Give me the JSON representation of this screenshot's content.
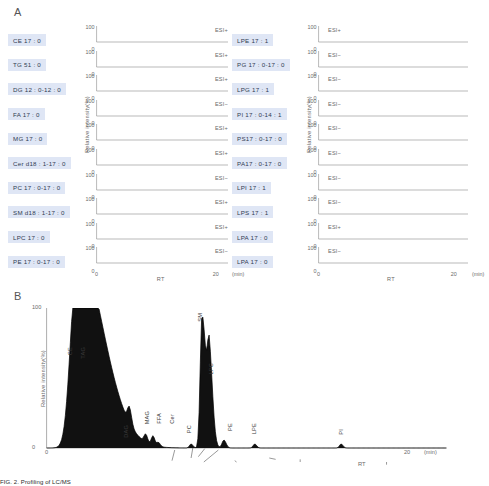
{
  "figure": {
    "panel_a_letter": "A",
    "panel_b_letter": "B",
    "caption": "FIG. 2.  Profiling of LC/MS"
  },
  "axes": {
    "y_label": "Relative intensity(%)",
    "y_top": "100",
    "y_zero": "0",
    "x_label": "RT",
    "x_zero": "0",
    "x_max": "20",
    "x_unit": "(min)"
  },
  "panel_a": {
    "left_group": {
      "rows": [
        {
          "label": "CE 17 : 0",
          "esi": "ESI+",
          "rt": 1.4,
          "width": 0.55,
          "height": 100,
          "tail": 0.9
        },
        {
          "label": "TG 51 : 0",
          "esi": "ESI+",
          "rt": 1.7,
          "width": 0.75,
          "height": 100,
          "tail": 1.6
        },
        {
          "label": "DG 12 : 0-12 : 0",
          "esi": "ESI+",
          "rt": 4.4,
          "width": 0.22,
          "height": 100,
          "tail": 0.2
        },
        {
          "label": "FA 17 : 0",
          "esi": "ESI−",
          "rt": 5.7,
          "width": 0.2,
          "height": 100,
          "tail": 0.2
        },
        {
          "label": "MG 17 : 0",
          "esi": "ESI+",
          "rt": 5.3,
          "width": 0.2,
          "height": 100,
          "tail": 0.2
        },
        {
          "label": "Cer d18 : 1-17 : 0",
          "esi": "ESI+",
          "rt": 5.4,
          "width": 0.2,
          "height": 100,
          "tail": 0.2
        },
        {
          "label": "PC 17 : 0-17 : 0",
          "esi": "ESI−",
          "rt": 6.4,
          "width": 0.22,
          "height": 100,
          "tail": 0.3
        },
        {
          "label": "SM d18 : 1-17 : 0",
          "esi": "ESI+",
          "rt": 6.6,
          "width": 0.22,
          "height": 100,
          "tail": 0.3
        },
        {
          "label": "LPC 17 : 0",
          "esi": "ESI+",
          "rt": 6.9,
          "width": 0.22,
          "height": 100,
          "tail": 0.3
        },
        {
          "label": "PE 17 : 0-17 : 0",
          "esi": "ESI−",
          "rt": 7.0,
          "width": 0.22,
          "height": 100,
          "tail": 0.3
        }
      ]
    },
    "right_group": {
      "rows": [
        {
          "label": "LPE 17 : 1",
          "esi": "ESI+",
          "rt": 5.6,
          "width": 0.22,
          "height": 100,
          "tail": 0.3
        },
        {
          "label": "PG 17 : 0-17 : 0",
          "esi": "ESI−",
          "rt": 6.3,
          "width": 0.22,
          "height": 100,
          "tail": 0.3
        },
        {
          "label": "LPG 17 : 1",
          "esi": "ESI−",
          "rt": 7.9,
          "width": 0.25,
          "height": 100,
          "tail": 0.4
        },
        {
          "label": "PI 17 : 0-14 : 1",
          "esi": "ESI−",
          "rt": 8.9,
          "width": 0.25,
          "height": 100,
          "tail": 0.4
        },
        {
          "label": "PS17 : 0-17 : 0",
          "esi": "ESI−",
          "rt": 9.1,
          "width": 0.28,
          "height": 100,
          "tail": 0.6
        },
        {
          "label": "PA17 : 0-17 : 0",
          "esi": "ESI−",
          "rt": 9.3,
          "width": 0.3,
          "height": 100,
          "tail": 0.7
        },
        {
          "label": "LPI 17 : 1",
          "esi": "ESI−",
          "rt": 9.5,
          "width": 0.35,
          "height": 100,
          "tail": 1.1
        },
        {
          "label": "LPS 17 : 1",
          "esi": "ESI−",
          "rt": 11.0,
          "width": 0.3,
          "height": 100,
          "tail": 0.6
        },
        {
          "label": "LPA 17 : 0",
          "esi": "ESI+",
          "rt": 12.2,
          "width": 0.35,
          "height": 100,
          "tail": 0.9
        },
        {
          "label": "LPA 17 : 0",
          "esi": "ESI−",
          "rt": 14.4,
          "width": 0.55,
          "height": 100,
          "tail": 1.8
        }
      ]
    }
  },
  "chart_data": {
    "type": "line",
    "title": "",
    "xlabel": "RT",
    "ylabel": "Relative intensity(%)",
    "xlim": [
      0,
      22
    ],
    "ylim": [
      0,
      105
    ],
    "x_ticks": [
      "0",
      "20"
    ],
    "y_ticks": [
      "0",
      "100"
    ],
    "x_unit": "(min)",
    "grid": false,
    "legend": "none",
    "peaks": [
      {
        "name": "CE",
        "rt": 1.55,
        "intensity": 78,
        "width": 0.3,
        "tail": 1.25,
        "label_x": 1.3,
        "label_y": 74
      },
      {
        "name": "TAG",
        "rt": 1.95,
        "intensity": 74,
        "width": 0.42,
        "tail": 1.45,
        "label_x": 2.05,
        "label_y": 74
      },
      {
        "name": "DAG",
        "rt": 4.55,
        "intensity": 12,
        "width": 0.1,
        "tail": 0.12,
        "label_x": 4.4,
        "label_y": 16
      },
      {
        "name": "MAG",
        "rt": 5.45,
        "intensity": 6,
        "width": 0.09,
        "tail": 0.1,
        "label_x": 5.55,
        "label_y": 26
      },
      {
        "name": "FFA",
        "rt": 5.85,
        "intensity": 7,
        "width": 0.09,
        "tail": 0.1,
        "label_x": 6.2,
        "label_y": 25
      },
      {
        "name": "Cer",
        "rt": 6.15,
        "intensity": 3,
        "width": 0.09,
        "tail": 0.1,
        "label_x": 6.95,
        "label_y": 24
      },
      {
        "name": "PC",
        "rt": 7.95,
        "intensity": 3,
        "width": 0.09,
        "tail": 0.1,
        "label_x": 7.85,
        "label_y": 16
      },
      {
        "name": "SM",
        "rt": 8.55,
        "intensity": 100,
        "width": 0.1,
        "tail": 0.22,
        "label_x": 8.45,
        "label_y": 100
      },
      {
        "name": "LPC",
        "rt": 8.95,
        "intensity": 64,
        "width": 0.1,
        "tail": 0.18,
        "label_x": 9.1,
        "label_y": 62
      },
      {
        "name": "PE",
        "rt": 9.75,
        "intensity": 6,
        "width": 0.1,
        "tail": 0.12,
        "label_x": 10.1,
        "label_y": 17
      },
      {
        "name": "LPE",
        "rt": 11.45,
        "intensity": 3,
        "width": 0.09,
        "tail": 0.1,
        "label_x": 11.45,
        "label_y": 17
      },
      {
        "name": "PI",
        "rt": 16.2,
        "intensity": 3,
        "width": 0.09,
        "tail": 0.1,
        "label_x": 16.2,
        "label_y": 13
      }
    ]
  }
}
